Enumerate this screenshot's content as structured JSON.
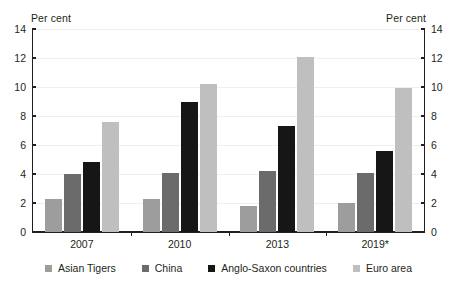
{
  "chart_data": {
    "type": "bar",
    "title": "",
    "xlabel": "",
    "ylabel": "Per cent",
    "ylabel_right": "Per cent",
    "ylim": [
      0,
      14
    ],
    "yticks": [
      0,
      2,
      4,
      6,
      8,
      10,
      12,
      14
    ],
    "grid": true,
    "legend_position": "bottom",
    "categories": [
      "2007",
      "2010",
      "2013",
      "2019*"
    ],
    "series": [
      {
        "name": "Asian Tigers",
        "color": "#9d9d9d",
        "values": [
          2.25,
          2.3,
          1.8,
          2.0
        ]
      },
      {
        "name": "China",
        "color": "#6b6b6b",
        "values": [
          4.0,
          4.1,
          4.2,
          4.1
        ]
      },
      {
        "name": "Anglo-Saxon countries",
        "color": "#161616",
        "values": [
          4.85,
          9.0,
          7.3,
          5.6
        ]
      },
      {
        "name": "Euro area",
        "color": "#bfbfbf",
        "values": [
          7.6,
          10.2,
          12.1,
          9.9
        ]
      }
    ]
  },
  "axis": {
    "left_unit": "Per cent",
    "right_unit": "Per cent"
  }
}
